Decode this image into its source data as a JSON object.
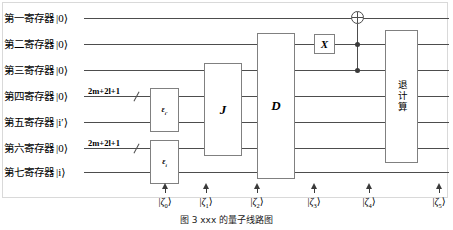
{
  "figure": {
    "caption": "图 3  xxx 的量子线路图",
    "registers": [
      {
        "name": "第一寄存器",
        "ket": "|0⟩",
        "y": 18
      },
      {
        "name": "第二寄存器",
        "ket": "|0⟩",
        "y": 44
      },
      {
        "name": "第三寄存器",
        "ket": "|0⟩",
        "y": 70
      },
      {
        "name": "第四寄存器",
        "ket": "|0⟩",
        "y": 96
      },
      {
        "name": "第五寄存器",
        "ket": "|i′⟩",
        "y": 122
      },
      {
        "name": "第六寄存器",
        "ket": "|0⟩",
        "y": 148
      },
      {
        "name": "第七寄存器",
        "ket": "|i⟩",
        "y": 172
      }
    ],
    "bundles": [
      {
        "label": "2m+2l+1",
        "wire": 4
      },
      {
        "label": "2m+2l+1",
        "wire": 6
      }
    ],
    "gates": [
      {
        "name": "epsilon-iprime-gate",
        "label": "ε",
        "sub": "i′",
        "wires": "4-5"
      },
      {
        "name": "epsilon-i-gate",
        "label": "ε",
        "sub": "i",
        "wires": "6-7"
      },
      {
        "name": "j-gate",
        "label": "J",
        "sub": "",
        "wires": "3-6"
      },
      {
        "name": "d-gate",
        "label": "D",
        "sub": "",
        "wires": "2-7"
      },
      {
        "name": "x-gate",
        "label": "X",
        "sub": "",
        "wires": "2"
      },
      {
        "name": "uncompute-gate",
        "label": "退计算",
        "sub": "",
        "wires": "1-6"
      }
    ],
    "toffoli": {
      "target_wire": 1,
      "control_wires": [
        2,
        3
      ]
    },
    "states": [
      {
        "label": "ζ",
        "index": "0"
      },
      {
        "label": "ζ",
        "index": "1"
      },
      {
        "label": "ζ",
        "index": "2"
      },
      {
        "label": "ζ",
        "index": "3"
      },
      {
        "label": "ζ",
        "index": "4"
      },
      {
        "label": "ζ",
        "index": "5"
      }
    ],
    "colors": {
      "wire": "#4d4d4d",
      "gate_border": "#808080",
      "frame": "#d9d9d9",
      "ink": "#000000"
    }
  }
}
